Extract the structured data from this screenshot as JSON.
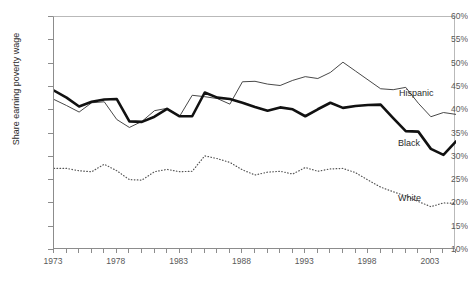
{
  "chart_data": {
    "type": "line",
    "title": "",
    "subtitle": "",
    "xlabel": "",
    "ylabel": "Share earning poverty wage",
    "xlim": [
      1973,
      2005
    ],
    "ylim": [
      10,
      60
    ],
    "ytick_labels": [
      "60%",
      "55%",
      "50%",
      "45%",
      "40%",
      "35%",
      "30%",
      "25%",
      "20%",
      "15%",
      "10%"
    ],
    "ytick_values": [
      60,
      55,
      50,
      45,
      40,
      35,
      30,
      25,
      20,
      15,
      10
    ],
    "xtick_labels": [
      "1973",
      "1978",
      "1983",
      "1988",
      "1993",
      "1998",
      "2003"
    ],
    "xtick_values": [
      1973,
      1978,
      1983,
      1988,
      1993,
      1998,
      2003
    ],
    "x": [
      1973,
      1974,
      1975,
      1976,
      1977,
      1978,
      1979,
      1980,
      1981,
      1982,
      1983,
      1984,
      1985,
      1986,
      1987,
      1988,
      1989,
      1990,
      1991,
      1992,
      1993,
      1994,
      1995,
      1996,
      1997,
      1998,
      1999,
      2000,
      2001,
      2002,
      2003,
      2004,
      2005
    ],
    "grid": false,
    "legend_position": "inline-right",
    "series": [
      {
        "name": "Hispanic",
        "style": "thin-solid",
        "color": "#333333",
        "label_x": 399,
        "label_y": 88,
        "values": [
          42.3,
          41.0,
          39.6,
          41.6,
          41.8,
          38.0,
          36.3,
          37.6,
          39.9,
          40.4,
          38.7,
          43.2,
          42.9,
          42.5,
          41.3,
          46.1,
          46.2,
          45.6,
          45.3,
          46.4,
          47.2,
          46.8,
          48.1,
          50.3,
          48.4,
          46.5,
          44.6,
          44.4,
          44.9,
          41.5,
          38.6,
          39.5,
          39.1
        ]
      },
      {
        "name": "Black",
        "style": "thick-solid",
        "color": "#111111",
        "label_x": 398,
        "label_y": 138,
        "values": [
          44.2,
          42.7,
          40.8,
          41.8,
          42.3,
          42.4,
          37.6,
          37.5,
          38.6,
          40.3,
          38.7,
          38.7,
          43.8,
          42.7,
          42.4,
          41.6,
          40.7,
          39.9,
          40.6,
          40.2,
          38.7,
          40.2,
          41.6,
          40.5,
          40.9,
          41.1,
          41.2,
          38.3,
          35.5,
          35.4,
          31.7,
          30.4,
          33.3
        ]
      },
      {
        "name": "White",
        "style": "dotted",
        "color": "#555555",
        "label_x": 398,
        "label_y": 193,
        "values": [
          27.5,
          27.5,
          27.0,
          26.8,
          28.4,
          27.0,
          25.1,
          25.0,
          26.8,
          27.3,
          26.8,
          26.9,
          30.2,
          29.6,
          28.8,
          27.2,
          26.1,
          26.7,
          26.9,
          26.3,
          27.7,
          26.9,
          27.4,
          27.5,
          26.6,
          25.0,
          23.5,
          22.5,
          21.6,
          20.4,
          19.3,
          20.1,
          20.0
        ]
      }
    ]
  }
}
